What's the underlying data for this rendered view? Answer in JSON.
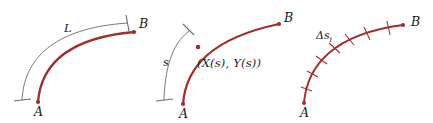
{
  "figure": {
    "width": 433,
    "height": 123,
    "background_color": "#ffffff",
    "curve_color": "#9e2f2f",
    "guide_color": "#6b6b6b",
    "label_color": "#1a1a1a"
  },
  "panels": [
    {
      "id": "panel-1",
      "name": "total-arc-length",
      "labels": {
        "start": "A",
        "end": "B",
        "arc": "L"
      }
    },
    {
      "id": "panel-2",
      "name": "arc-length-parameter",
      "labels": {
        "start": "A",
        "end": "B",
        "arc": "s",
        "point": "(X(s), Y(s))"
      }
    },
    {
      "id": "panel-3",
      "name": "arc-length-subdivision",
      "labels": {
        "start": "A",
        "end": "B",
        "segment": "Δs",
        "segment_subscript": "i"
      },
      "tick_count": 7
    }
  ]
}
